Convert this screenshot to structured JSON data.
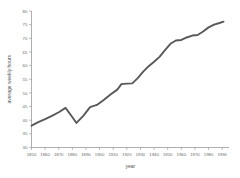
{
  "chart_data": {
    "type": "line",
    "title": "",
    "xlabel": "year",
    "ylabel": "average weekly hours",
    "xlim": [
      1850,
      1995
    ],
    "ylim": [
      30,
      80
    ],
    "grid": false,
    "legend": null,
    "xticks": [
      1850,
      1860,
      1870,
      1880,
      1890,
      1900,
      1910,
      1920,
      1930,
      1940,
      1950,
      1960,
      1970,
      1980,
      1990
    ],
    "yticks": [
      30,
      35,
      40,
      45,
      50,
      55,
      60,
      65,
      70,
      75,
      80
    ],
    "series": [
      {
        "name": "average weekly hours",
        "color": "#595959",
        "x": [
          1850,
          1855,
          1860,
          1865,
          1870,
          1875,
          1879,
          1883,
          1888,
          1893,
          1898,
          1903,
          1908,
          1913,
          1916,
          1920,
          1924,
          1928,
          1932,
          1936,
          1940,
          1944,
          1948,
          1952,
          1956,
          1960,
          1964,
          1968,
          1972,
          1976,
          1980,
          1984,
          1988,
          1991
        ],
        "y": [
          38.0,
          39.3,
          40.4,
          41.6,
          42.9,
          44.5,
          41.8,
          39.0,
          41.6,
          44.8,
          45.6,
          47.4,
          49.4,
          51.2,
          53.2,
          53.4,
          53.5,
          55.4,
          57.8,
          59.8,
          61.4,
          63.2,
          65.7,
          68.0,
          69.2,
          69.4,
          70.3,
          71.0,
          71.2,
          72.5,
          74.0,
          75.0,
          75.6,
          76.1
        ]
      }
    ]
  },
  "axes": {
    "x_title": "year",
    "y_title": "average weekly hours"
  }
}
